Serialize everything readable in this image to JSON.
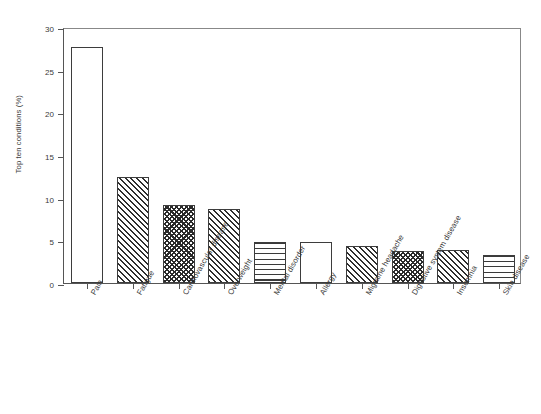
{
  "chart_data": {
    "type": "bar",
    "title": "",
    "subtitle": "",
    "xlabel": "",
    "ylabel": "Top ten conditions (%)",
    "ylim": [
      0,
      30
    ],
    "yticks": [
      0,
      5,
      10,
      15,
      20,
      25,
      30
    ],
    "ytick_labels": [
      "0",
      "5",
      "10",
      "15",
      "20",
      "25",
      "30"
    ],
    "grid": false,
    "legend": "none",
    "categories": [
      "Pain",
      "Fatigue",
      "Cardiovascular disease",
      "Overweight",
      "Mental disorder",
      "Allergy",
      "Migraine headache",
      "Digestive system disease",
      "Insomnia",
      "Skin disease"
    ],
    "values": [
      27.6,
      12.4,
      9.2,
      8.7,
      4.75,
      4.85,
      4.3,
      3.8,
      3.85,
      3.3
    ],
    "bar_patterns": [
      "blank",
      "diagonal",
      "checkerboard",
      "diagonal",
      "horizontal",
      "blank",
      "diagonal",
      "checkerboard",
      "diagonal",
      "horizontal"
    ],
    "colors": {
      "background": "#ffffff",
      "bar_fill": "#ffffff",
      "bar_edge": "#3d3d3d",
      "pattern": "#2f2f2f",
      "axis": "#555555",
      "text": "#3a3a3a"
    }
  }
}
